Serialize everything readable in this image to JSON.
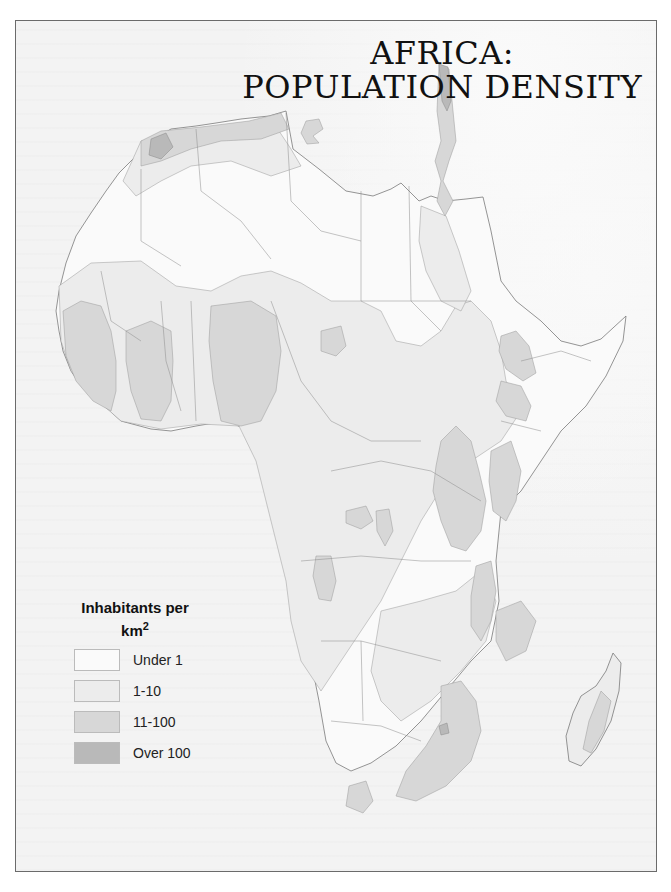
{
  "title": {
    "line1": "AFRICA:",
    "line2": "POPULATION DENSITY"
  },
  "legend": {
    "title_line1": "Inhabitants per",
    "title_line2": "km",
    "title_sup": "2",
    "items": [
      {
        "label": "Under 1",
        "color": "#fafafa"
      },
      {
        "label": "1-10",
        "color": "#ececec"
      },
      {
        "label": "11-100",
        "color": "#d7d7d7"
      },
      {
        "label": "Over 100",
        "color": "#b9b9b9"
      }
    ]
  },
  "colors": {
    "under_1": "#fafafa",
    "1_10": "#ececec",
    "11_100": "#d7d7d7",
    "over_100": "#b9b9b9",
    "border": "#7a7a7a"
  }
}
